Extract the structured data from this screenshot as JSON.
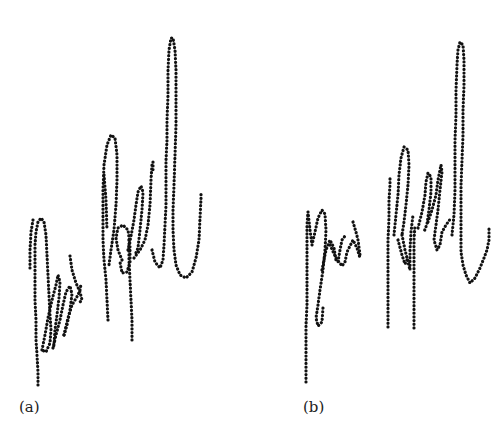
{
  "figure": {
    "panels": [
      {
        "label": "(a)",
        "description": "Online signature sample rendered as dotted pen trajectory",
        "strokes": [
          "M38,385 L38,372 L37,355 L36,340 L36,320 L35,300 L35,280 L35,262 L35,245 L36,232 L38,222 L41,218 L44,222 L46,235 L47,255 L48,275 L49,295 L50,315 L51,330 L50,343 L46,352 L42,350",
          "M30,268 L30,250 L31,232 L33,220",
          "M42,350 L45,335 L48,318 L52,300 L56,285 L58,275 L60,282 L59,298 L57,315 L55,330 L54,345 L53,348",
          "M53,348 L56,335 L60,320 L63,305 L66,292 L70,286 L72,294 L70,310 L67,325 L64,335",
          "M64,335 L68,318 L72,305 L75,300 L78,295 L80,290 L81,284",
          "M70,256 L72,270 L76,283 L80,292 L82,300 L79,303",
          "M108,320 L107,300 L106,280 L104,260 L103,240 L103,215 L103,190 L104,165 L107,145 L111,135 L115,138 L117,155 L117,180 L116,205 L114,230 L111,250 L109,265",
          "M104,175 L106,200 L107,230",
          "M132,340 L132,320 L131,300 L130,280 L129,260 L129,240",
          "M122,260 L118,250 L116,238 L118,228 L123,225 L128,230 L130,245 L130,262 L127,272 L122,273 L120,262",
          "M128,250 L131,236 L134,220 L136,205 L138,192 L141,186 L143,192 L142,210 L140,230 L138,248 L135,255",
          "M134,258 L140,250 L145,240 L148,225 L150,205 L151,180 L152,165 L153,162 L153,170",
          "M152,250 L155,262 L160,268 L163,260 L164,245 L165,225 L166,205 L166,180 L166,160 L167,140 L167,120 L168,95 L168,70 L169,50 L171,38 L173,38 L175,50 L176,70 L176,95 L176,125 L175,155 L174,185 L173,210 L173,230 L174,250 L176,265 L180,275 L186,278 L192,272 L196,258 L199,240 L200,218 L201,198 L201,192"
        ]
      },
      {
        "label": "(b)",
        "description": "Second online signature sample rendered as dotted pen trajectory",
        "strokes": [
          "M306,382 L306,365 L306,345 L306,325 L307,305 L307,285 L307,265 L307,245 L307,225 L308,212",
          "M308,212 L310,230 L312,245 L315,232 L318,218 L322,210 L325,214 L326,230 L325,250 L323,270 L320,290 L318,305 L316,318 L318,326 L322,322 L323,308",
          "M322,270 L326,250 L330,240 L334,248 L336,260 L338,262 L340,250 L342,240 L345,236",
          "M330,245 L336,258 L342,266 L345,262 L347,252 L350,246 L353,240 L357,248 L360,258",
          "M353,222 L356,232 L358,240 L360,255",
          "M388,327 L388,305 L388,285 L388,262 L388,240 L389,218 L389,200 L390,185 L390,178",
          "M394,235 L396,215 L398,195 L399,175 L401,158 L404,147 L408,150 L409,165 L408,185 L406,205 L404,222 L402,235",
          "M402,235 L405,250 L408,262 L410,270 L410,250 L411,232 L413,215",
          "M414,328 L414,305 L414,282 L414,260 L414,240 L415,225",
          "M398,240 L402,255 L405,264 L408,258",
          "M418,228 L422,212 L425,195 L426,182 L428,173 L431,177 L431,192 L429,210 L427,224 L424,232",
          "M428,222 L432,210 L436,195 L438,180 L440,170 L441,165 L442,172 L440,190 L438,210 L436,225 L434,240 L437,250 L440,245 L442,232 L446,225 L451,218",
          "M452,235 L454,215 L455,190 L455,165 L455,140 L456,115 L456,90 L457,65 L458,50 L460,42 L463,45 L464,60 L464,85 L463,110 L463,135 L462,160 L461,185 L461,210 L461,235 L461,252 L463,265 L466,275 L470,283 L475,278 L480,268 L484,258 L487,250 L489,240 L489,228"
        ]
      }
    ]
  },
  "style": {
    "ink_color": "#111111",
    "background": "#ffffff"
  }
}
